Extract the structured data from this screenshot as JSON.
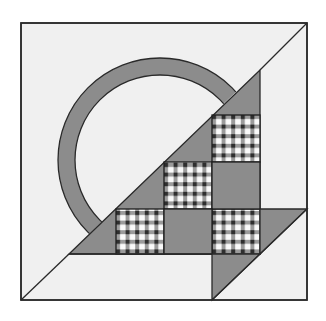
{
  "colors": {
    "background": "#ffffff",
    "block_fill": "#f0f0f0",
    "solid_fill": "#8c8c8c",
    "outline": "#2a2a2a",
    "gingham_dark": "#3a3a3a",
    "gingham_light": "#fafafa"
  },
  "block": {
    "outer_square": {
      "x": 21,
      "y": 23,
      "size": 286
    },
    "handle": {
      "cx": 160,
      "cy": 160,
      "outer_r": 102,
      "inner_r": 85
    },
    "checker_squares": [
      {
        "col": 2,
        "row": 0
      },
      {
        "col": 1,
        "row": 1
      },
      {
        "col": 0,
        "row": 2
      },
      {
        "col": 2,
        "row": 2
      }
    ],
    "solid_squares": [
      {
        "col": 2,
        "row": 1
      },
      {
        "col": 1,
        "row": 2
      }
    ]
  }
}
